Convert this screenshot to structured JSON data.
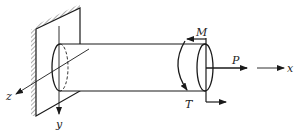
{
  "figure": {
    "colors": {
      "line": "#1a1a1a",
      "background": "#ffffff"
    }
  },
  "axes": {
    "x": {
      "label": "x"
    },
    "y": {
      "label": "y"
    },
    "z": {
      "label": "z"
    }
  },
  "loads": {
    "axial_force": {
      "label": "P"
    },
    "moment": {
      "label": "M"
    },
    "torque": {
      "label": "T"
    }
  },
  "support": {
    "type": "fixed-wall"
  }
}
